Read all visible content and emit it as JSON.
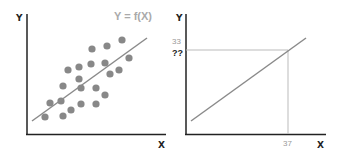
{
  "chart_data": [
    {
      "type": "scatter",
      "title": "Y = f(X)",
      "xlabel": "X",
      "ylabel": "Y",
      "grid": false,
      "points": [
        [
          122,
          40
        ],
        [
          107,
          46
        ],
        [
          92,
          49
        ],
        [
          129,
          58
        ],
        [
          105,
          63
        ],
        [
          91,
          64
        ],
        [
          79,
          67
        ],
        [
          68,
          70
        ],
        [
          119,
          70
        ],
        [
          110,
          74
        ],
        [
          79,
          79
        ],
        [
          63,
          86
        ],
        [
          81,
          88
        ],
        [
          96,
          88
        ],
        [
          105,
          95
        ],
        [
          50,
          103
        ],
        [
          61,
          101
        ],
        [
          71,
          110
        ],
        [
          81,
          104
        ],
        [
          96,
          104
        ],
        [
          45,
          117
        ],
        [
          63,
          116
        ]
      ],
      "trend_line": {
        "x1": 32,
        "y1": 121,
        "x2": 147,
        "y2": 38
      },
      "annotation": "Y = f(X)"
    },
    {
      "type": "line",
      "xlabel": "X",
      "ylabel": "Y",
      "grid": false,
      "line": {
        "x1": 191,
        "y1": 121,
        "x2": 306,
        "y2": 38
      },
      "guide": {
        "x_value": "37",
        "y_value_label": "33",
        "y_unknown_label": "??"
      }
    }
  ],
  "left_chart": {
    "y_label": "Y",
    "x_label": "X",
    "formula": "Y = f(X)",
    "dot_color": "#888888",
    "line_color": "#888888"
  },
  "right_chart": {
    "y_label": "Y",
    "x_label": "X",
    "y_tick": "33",
    "y_unknown": "??",
    "x_tick": "37"
  }
}
